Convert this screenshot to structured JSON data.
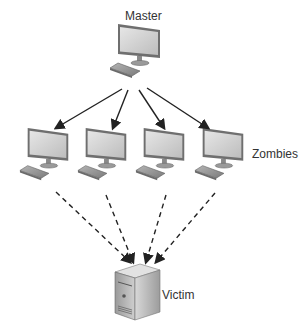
{
  "diagram": {
    "master": {
      "label": "Master",
      "icon": "desktop-computer-icon"
    },
    "zombies": {
      "label": "Zombies",
      "count": 4,
      "icon": "desktop-computer-icon"
    },
    "victim": {
      "label": "Victim",
      "icon": "server-tower-icon"
    },
    "edges": {
      "master_to_zombies": "solid-arrow",
      "zombies_to_victim": "dashed-arrow"
    }
  }
}
